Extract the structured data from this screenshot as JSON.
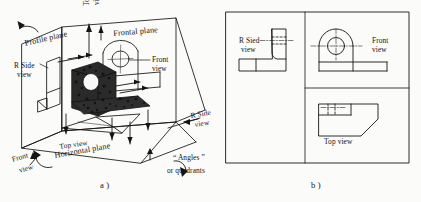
{
  "figure": {
    "caption_a": "a )",
    "caption_b": "b )"
  },
  "pictorial": {
    "planes": {
      "profile": "Profile plane",
      "frontal": "Frontal plane",
      "horizontal": "Horizontal plane"
    },
    "views": {
      "top_upper": "Top\nview",
      "top_upper_line1": "Top",
      "top_upper_line2": "view",
      "front_right_line1": "Front",
      "front_right_line2": "view",
      "rside_left_line1": "R Side",
      "rside_left_line2": "view",
      "rside_right_line1": "R Side",
      "rside_right_line2": "view",
      "front_lower_line1": "Front",
      "front_lower_line2": "view",
      "top_lower": "Top view"
    },
    "quadrants": {
      "line1": "“ Angles ”",
      "line2": "or quadrants"
    }
  },
  "orthographic": {
    "rside_line1": "R Sied",
    "rside_line2": "view",
    "front_line1": "Front",
    "front_line2": "view",
    "top_label": "Top view"
  },
  "colors": {
    "ink": "#141414",
    "paper": "#fbfbf9",
    "shading": "#1b1b1b"
  }
}
